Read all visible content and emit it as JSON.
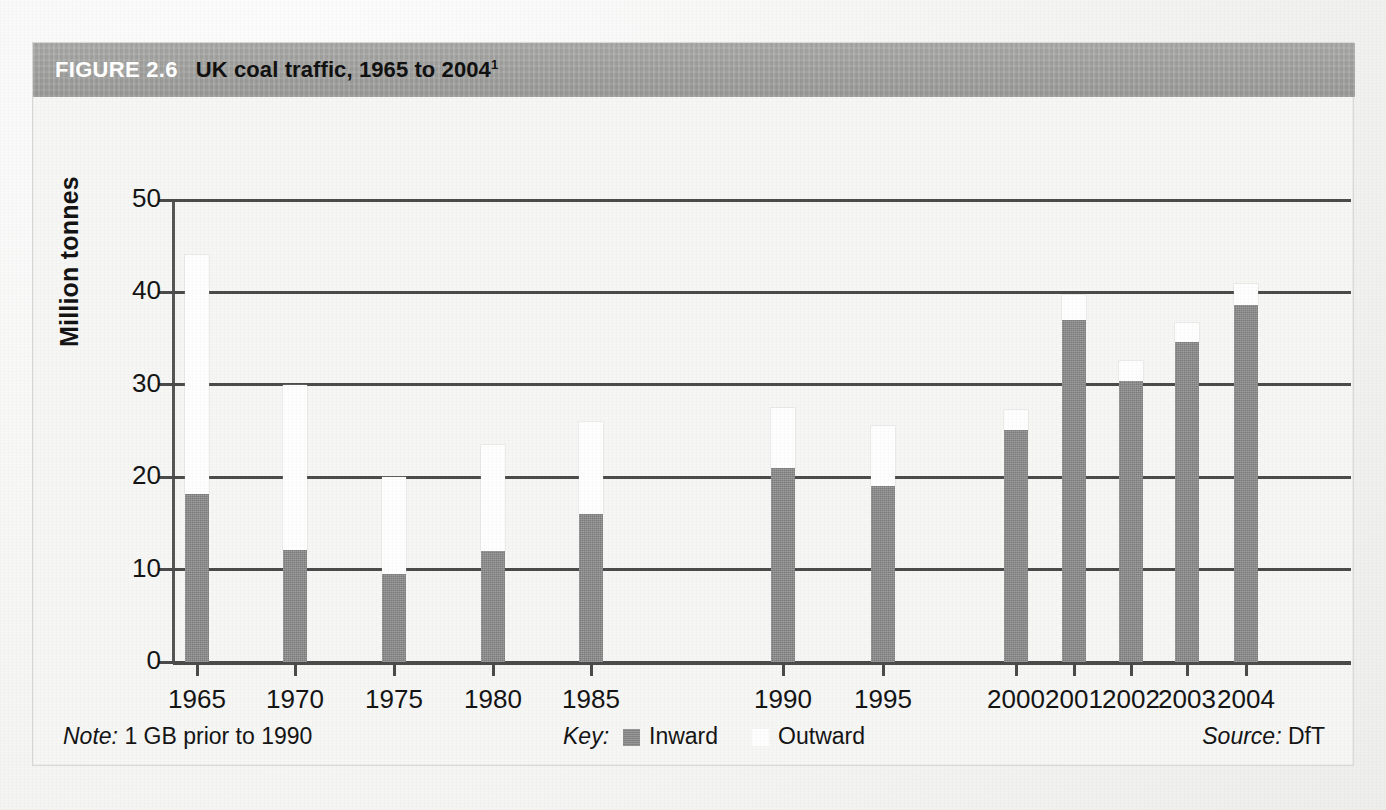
{
  "figure": {
    "number_label": "FIGURE 2.6",
    "title": "UK coal traffic, 1965 to 2004",
    "title_footnote_marker": "1"
  },
  "footer": {
    "note_label": "Note:",
    "note_text": "1 GB prior to 1990",
    "key_label": "Key:",
    "key_inward": "Inward",
    "key_outward": "Outward",
    "source_label": "Source:",
    "source_text": "DfT"
  },
  "colors": {
    "title_bar": "#a5a5a3",
    "inward": "#8a8a8a",
    "outward": "#fefefe",
    "axis": "#4b4b4b",
    "page": "#f6f6f4"
  },
  "axes": {
    "y_label": "Million tonnes",
    "y_ticks": [
      "0",
      "10",
      "20",
      "30",
      "40",
      "50"
    ],
    "y_min": 0,
    "y_max": 50,
    "x_ticks": [
      "1965",
      "1970",
      "1975",
      "1980",
      "1985",
      "1990",
      "1995",
      "2000",
      "2001",
      "2002",
      "2003",
      "2004"
    ]
  },
  "chart_data": {
    "type": "bar",
    "subtype": "stacked",
    "title": "UK coal traffic, 1965 to 2004",
    "xlabel": "",
    "ylabel": "Million tonnes",
    "ylim": [
      0,
      50
    ],
    "ytick_values": [
      0,
      10,
      20,
      30,
      40,
      50
    ],
    "grid": "horizontal",
    "legend": [
      "Inward",
      "Outward"
    ],
    "legend_position": "bottom-center",
    "note": "1 GB prior to 1990",
    "source": "DfT",
    "categories": [
      "1965",
      "1970",
      "1975",
      "1980",
      "1985",
      "1990",
      "1995",
      "2000",
      "2001",
      "2002",
      "2003",
      "2004"
    ],
    "series": [
      {
        "name": "Inward",
        "color": "#8a8a8a",
        "values": [
          18.2,
          12.1,
          9.5,
          12.0,
          16.0,
          21.0,
          19.0,
          25.1,
          37.0,
          30.4,
          34.6,
          38.6
        ]
      },
      {
        "name": "Outward",
        "color": "#fefefe",
        "values": [
          25.9,
          17.9,
          10.5,
          11.5,
          10.0,
          6.5,
          6.5,
          2.2,
          2.7,
          2.2,
          2.1,
          2.3
        ]
      }
    ],
    "totals": [
      44.1,
      30.0,
      20.0,
      23.5,
      26.0,
      27.5,
      25.5,
      27.3,
      39.7,
      32.6,
      36.7,
      40.9
    ],
    "bar_pixel_layout": {
      "x_centers_px": [
        196,
        294,
        393,
        492,
        590,
        782,
        882,
        1015,
        1073,
        1130,
        1186,
        1245
      ],
      "bar_width_px": 24
    }
  }
}
